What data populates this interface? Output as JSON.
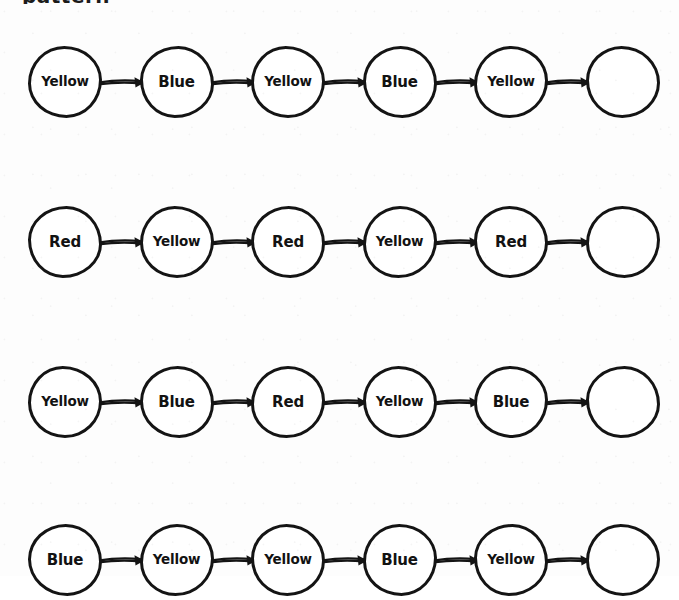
{
  "page": {
    "partial_heading_text": "pattern",
    "background_color": "#fdfdfd",
    "ink_color": "#141414",
    "width": 679,
    "height": 576
  },
  "legend": {
    "color_words": [
      "Yellow",
      "Blue",
      "Red"
    ]
  },
  "rows": [
    {
      "index": 1,
      "top": 46,
      "nodes": [
        {
          "label": "Yellow",
          "filled": true
        },
        {
          "label": "Blue",
          "filled": true
        },
        {
          "label": "Yellow",
          "filled": true
        },
        {
          "label": "Blue",
          "filled": true
        },
        {
          "label": "Yellow",
          "filled": true
        },
        {
          "label": "",
          "filled": false
        }
      ]
    },
    {
      "index": 2,
      "top": 206,
      "nodes": [
        {
          "label": "Red",
          "filled": true
        },
        {
          "label": "Yellow",
          "filled": true
        },
        {
          "label": "Red",
          "filled": true
        },
        {
          "label": "Yellow",
          "filled": true
        },
        {
          "label": "Red",
          "filled": true
        },
        {
          "label": "",
          "filled": false
        }
      ]
    },
    {
      "index": 3,
      "top": 366,
      "nodes": [
        {
          "label": "Yellow",
          "filled": true
        },
        {
          "label": "Blue",
          "filled": true
        },
        {
          "label": "Red",
          "filled": true
        },
        {
          "label": "Yellow",
          "filled": true
        },
        {
          "label": "Blue",
          "filled": true
        },
        {
          "label": "",
          "filled": false
        }
      ]
    },
    {
      "index": 4,
      "top": 524,
      "nodes": [
        {
          "label": "Blue",
          "filled": true
        },
        {
          "label": "Yellow",
          "filled": true
        },
        {
          "label": "Yellow",
          "filled": true
        },
        {
          "label": "Blue",
          "filled": true
        },
        {
          "label": "Yellow",
          "filled": true
        },
        {
          "label": "",
          "filled": false
        }
      ]
    }
  ],
  "geometry": {
    "node_left_positions": [
      28,
      352,
      160,
      455,
      588,
      0
    ],
    "node_xs": [
      28,
      160,
      292,
      352,
      455,
      588
    ],
    "node_width": 74,
    "node_height": 72,
    "row_spacing": 160
  }
}
